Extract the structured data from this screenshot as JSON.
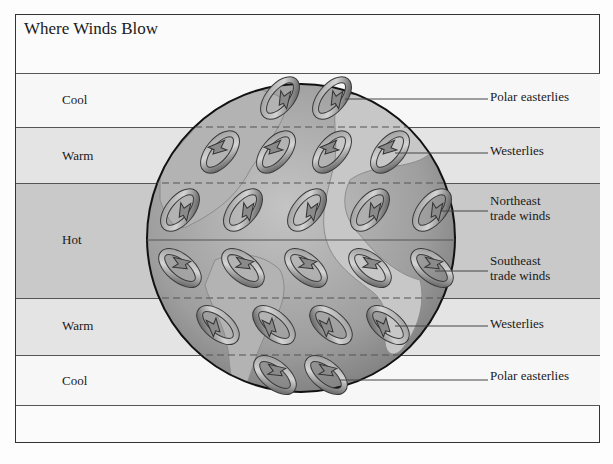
{
  "title": "Where Winds Blow",
  "bands": [
    {
      "label": "Cool",
      "top": 73,
      "bottom": 127,
      "color": "#f7f7f7"
    },
    {
      "label": "Warm",
      "top": 127,
      "bottom": 183,
      "color": "#e4e4e4"
    },
    {
      "label": "Hot",
      "top": 183,
      "bottom": 298,
      "color": "#c9c9c9"
    },
    {
      "label": "Warm",
      "top": 298,
      "bottom": 355,
      "color": "#e4e4e4"
    },
    {
      "label": "Cool",
      "top": 355,
      "bottom": 406,
      "color": "#f7f7f7"
    }
  ],
  "wind_labels": [
    {
      "text": "Polar easterlies",
      "y": 89
    },
    {
      "text": "Westerlies",
      "y": 142
    },
    {
      "text": "Northeast trade winds",
      "line1": "Northeast",
      "line2": "trade winds",
      "y": 193
    },
    {
      "text": "Southeast trade winds",
      "line1": "Southeast",
      "line2": "trade winds",
      "y": 253
    },
    {
      "text": "Westerlies",
      "y": 315
    },
    {
      "text": "Polar easterlies",
      "y": 367
    }
  ],
  "colors": {
    "globe": "#9a9a9a",
    "land": "#b8b8b8",
    "arrow": "#6e6e6e",
    "line": "#555555"
  }
}
